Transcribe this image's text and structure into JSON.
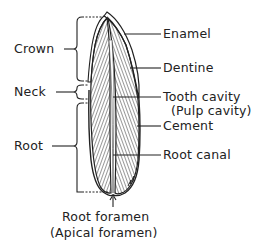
{
  "diagram": {
    "left_labels": {
      "crown": "Crown",
      "neck": "Neck",
      "root": "Root"
    },
    "right_labels": {
      "enamel": "Enamel",
      "dentine": "Dentine",
      "tooth_cavity": "Tooth cavity",
      "pulp_cavity": "(Pulp cavity)",
      "cement": "Cement",
      "root_canal": "Root canal"
    },
    "bottom_labels": {
      "root_foramen": "Root foramen",
      "apical_foramen": "(Apical foramen)"
    },
    "colors": {
      "ink": "#222222",
      "background": "#ffffff"
    }
  }
}
